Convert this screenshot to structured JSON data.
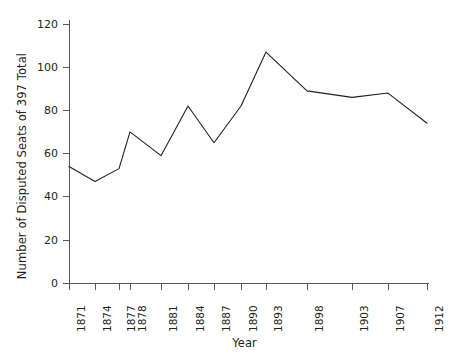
{
  "chart_data": {
    "type": "line",
    "title": "",
    "xlabel": "Year",
    "ylabel": "Number of Disputed Seats of 397 Total",
    "categories": [
      "1871",
      "1874",
      "1877",
      "1878",
      "1881",
      "1884",
      "1887",
      "1890",
      "1893",
      "1898",
      "1903",
      "1907",
      "1912"
    ],
    "values": [
      54,
      47,
      53,
      70,
      59,
      82,
      65,
      82,
      107,
      89,
      86,
      88,
      74
    ],
    "series": [
      {
        "name": "Disputed Seats",
        "values": [
          54,
          47,
          53,
          70,
          59,
          82,
          65,
          82,
          107,
          89,
          86,
          88,
          74
        ]
      }
    ],
    "yticks": [
      0,
      20,
      40,
      60,
      80,
      100,
      120
    ],
    "ylim": [
      0,
      125
    ],
    "grid": false,
    "legend": "none",
    "line_color": "#231f20",
    "axis_color": "#58595b",
    "background": "#ffffff"
  },
  "axes": {
    "y_title": "Number of Disputed Seats of 397 Total",
    "x_title": "Year",
    "y_tick_labels": [
      "120",
      "100",
      "80",
      "60",
      "40",
      "20",
      "0"
    ],
    "x_tick_labels": [
      "1871",
      "1874",
      "1877",
      "1878",
      "1881",
      "1884",
      "1887",
      "1890",
      "1893",
      "1898",
      "1903",
      "1907",
      "1912"
    ]
  }
}
